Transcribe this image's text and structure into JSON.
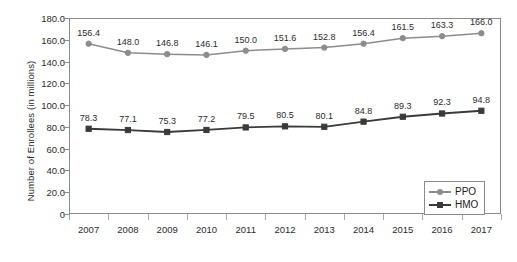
{
  "chart_data": {
    "type": "line",
    "title": "",
    "xlabel": "",
    "ylabel": "Number of Enrollees (in millions)",
    "categories": [
      "2007",
      "2008",
      "2009",
      "2010",
      "2011",
      "2012",
      "2013",
      "2014",
      "2015",
      "2016",
      "2017"
    ],
    "ylim": [
      0,
      180
    ],
    "ytick_labels": [
      "0",
      "20.0",
      "40.0",
      "60.0",
      "80.0",
      "100.0",
      "120.0",
      "140.0",
      "160.0",
      "180.0"
    ],
    "ytick_values": [
      0,
      20,
      40,
      60,
      80,
      100,
      120,
      140,
      160,
      180
    ],
    "grid": false,
    "legend_position": "lower right",
    "series": [
      {
        "name": "PPO",
        "color": "#8c8c8c",
        "marker": "circle",
        "values": [
          156.4,
          148.0,
          146.8,
          146.1,
          150.0,
          151.6,
          152.8,
          156.4,
          161.5,
          163.3,
          166.0
        ],
        "labels": [
          "156.4",
          "148.0",
          "146.8",
          "146.1",
          "150.0",
          "151.6",
          "152.8",
          "156.4",
          "161.5",
          "163.3",
          "166.0"
        ]
      },
      {
        "name": "HMO",
        "color": "#3a3a3a",
        "marker": "square",
        "values": [
          78.3,
          77.1,
          75.3,
          77.2,
          79.5,
          80.5,
          80.1,
          84.8,
          89.3,
          92.3,
          94.8
        ],
        "labels": [
          "78.3",
          "77.1",
          "75.3",
          "77.2",
          "79.5",
          "80.5",
          "80.1",
          "84.8",
          "89.3",
          "92.3",
          "94.8"
        ]
      }
    ]
  },
  "legend": {
    "entries": [
      {
        "label": "PPO"
      },
      {
        "label": "HMO"
      }
    ]
  },
  "colors": {
    "ppo": "#8c8c8c",
    "hmo": "#3a3a3a",
    "axis": "#8a8a8a",
    "text": "#2b2b2b",
    "background": "#ffffff"
  }
}
